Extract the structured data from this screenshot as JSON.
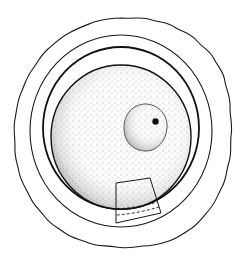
{
  "figure": {
    "title": "",
    "colors": {
      "background": "#ffffff",
      "ink": "#1a1a1a",
      "stipple": "#555555",
      "nucleolus": "#111111"
    },
    "parts": [
      {
        "id": "outer-layer",
        "label": "",
        "shape": "wavy-circle"
      },
      {
        "id": "middle-ring",
        "label": "",
        "shape": "circle"
      },
      {
        "id": "inner-ring",
        "label": "",
        "shape": "circle"
      },
      {
        "id": "cytoplasm",
        "label": "",
        "shape": "stippled-circle"
      },
      {
        "id": "nucleus",
        "label": "",
        "shape": "stippled-circle"
      },
      {
        "id": "nucleolus",
        "label": "",
        "shape": "dot"
      },
      {
        "id": "inset-box",
        "label": "",
        "shape": "quadrilateral-with-dashed-lines"
      }
    ]
  }
}
